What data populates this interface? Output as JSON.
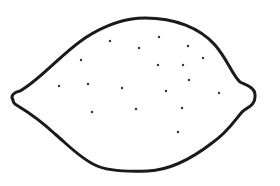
{
  "figure": {
    "subject": "lemon outline drawing",
    "background": "#ffffff",
    "stroke_color": "#1a1a1a",
    "stroke_width": 3,
    "outline_path": "M 13 100 C 10 96 14 92 20 91 C 40 80 60 55 85 38 C 105 25 125 18 145 18 C 175 18 200 28 215 45 C 228 60 232 75 240 82 C 248 86 256 88 255 97 C 255 105 248 107 242 112 C 235 120 228 132 212 143 C 190 160 170 170 148 171 C 125 172 105 170 95 165 C 80 158 68 145 55 134 C 42 122 28 112 18 106 C 14 104 13 102 13 100 Z",
    "dot_color": "#333333",
    "dot_radius": 1.2,
    "dots": [
      {
        "x": 110,
        "y": 41
      },
      {
        "x": 139,
        "y": 48
      },
      {
        "x": 159,
        "y": 37
      },
      {
        "x": 81,
        "y": 60
      },
      {
        "x": 188,
        "y": 46
      },
      {
        "x": 203,
        "y": 58
      },
      {
        "x": 59,
        "y": 86
      },
      {
        "x": 88,
        "y": 84
      },
      {
        "x": 122,
        "y": 88
      },
      {
        "x": 158,
        "y": 65
      },
      {
        "x": 183,
        "y": 65
      },
      {
        "x": 189,
        "y": 80
      },
      {
        "x": 166,
        "y": 91
      },
      {
        "x": 219,
        "y": 93
      },
      {
        "x": 92,
        "y": 112
      },
      {
        "x": 136,
        "y": 109
      },
      {
        "x": 182,
        "y": 108
      },
      {
        "x": 178,
        "y": 132
      }
    ]
  }
}
